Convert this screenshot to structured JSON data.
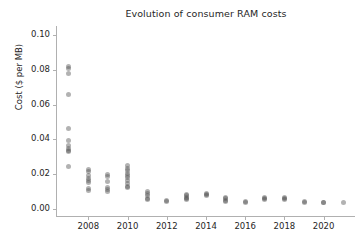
{
  "chart_data": {
    "type": "scatter",
    "title": "Evolution of consumer RAM costs",
    "xlabel": "",
    "ylabel": "Cost ($ per MB)",
    "xlim": [
      2006.4,
      2021.6
    ],
    "ylim": [
      -0.004,
      0.104
    ],
    "grid": false,
    "legend": null,
    "marker": {
      "shape": "circle",
      "color": "#555555",
      "opacity": 0.45,
      "size_px": 5
    },
    "xticks": [
      2008,
      2010,
      2012,
      2014,
      2016,
      2018,
      2020
    ],
    "xtick_labels": [
      "2008",
      "2010",
      "2012",
      "2014",
      "2016",
      "2018",
      "2020"
    ],
    "yticks": [
      0.0,
      0.02,
      0.04,
      0.06,
      0.08,
      0.1
    ],
    "ytick_labels": [
      "0.00",
      "0.02",
      "0.04",
      "0.06",
      "0.08",
      "0.10"
    ],
    "points": [
      {
        "x": 2007,
        "y": 0.082
      },
      {
        "x": 2007,
        "y": 0.0805
      },
      {
        "x": 2007,
        "y": 0.078
      },
      {
        "x": 2007,
        "y": 0.066
      },
      {
        "x": 2007,
        "y": 0.0462
      },
      {
        "x": 2007,
        "y": 0.0392
      },
      {
        "x": 2007,
        "y": 0.0365
      },
      {
        "x": 2007,
        "y": 0.035
      },
      {
        "x": 2007,
        "y": 0.0338
      },
      {
        "x": 2007,
        "y": 0.033
      },
      {
        "x": 2007,
        "y": 0.0245
      },
      {
        "x": 2008,
        "y": 0.0228
      },
      {
        "x": 2008,
        "y": 0.0215
      },
      {
        "x": 2008,
        "y": 0.0195
      },
      {
        "x": 2008,
        "y": 0.0178
      },
      {
        "x": 2008,
        "y": 0.0165
      },
      {
        "x": 2008,
        "y": 0.015
      },
      {
        "x": 2008,
        "y": 0.0118
      },
      {
        "x": 2008,
        "y": 0.0105
      },
      {
        "x": 2009,
        "y": 0.0198
      },
      {
        "x": 2009,
        "y": 0.0185
      },
      {
        "x": 2009,
        "y": 0.016
      },
      {
        "x": 2009,
        "y": 0.0122
      },
      {
        "x": 2009,
        "y": 0.0112
      },
      {
        "x": 2009,
        "y": 0.0102
      },
      {
        "x": 2010,
        "y": 0.0248
      },
      {
        "x": 2010,
        "y": 0.0235
      },
      {
        "x": 2010,
        "y": 0.0222
      },
      {
        "x": 2010,
        "y": 0.0205
      },
      {
        "x": 2010,
        "y": 0.0192
      },
      {
        "x": 2010,
        "y": 0.018
      },
      {
        "x": 2010,
        "y": 0.0165
      },
      {
        "x": 2010,
        "y": 0.0148
      },
      {
        "x": 2010,
        "y": 0.0132
      },
      {
        "x": 2010,
        "y": 0.0125
      },
      {
        "x": 2011,
        "y": 0.0102
      },
      {
        "x": 2011,
        "y": 0.0092
      },
      {
        "x": 2011,
        "y": 0.0078
      },
      {
        "x": 2011,
        "y": 0.0062
      },
      {
        "x": 2011,
        "y": 0.0055
      },
      {
        "x": 2012,
        "y": 0.0048
      },
      {
        "x": 2012,
        "y": 0.0042
      },
      {
        "x": 2013,
        "y": 0.0085
      },
      {
        "x": 2013,
        "y": 0.0078
      },
      {
        "x": 2013,
        "y": 0.0068
      },
      {
        "x": 2013,
        "y": 0.006
      },
      {
        "x": 2013,
        "y": 0.0052
      },
      {
        "x": 2014,
        "y": 0.0092
      },
      {
        "x": 2014,
        "y": 0.0085
      },
      {
        "x": 2014,
        "y": 0.0078
      },
      {
        "x": 2015,
        "y": 0.0068
      },
      {
        "x": 2015,
        "y": 0.0058
      },
      {
        "x": 2015,
        "y": 0.0048
      },
      {
        "x": 2015,
        "y": 0.0042
      },
      {
        "x": 2016,
        "y": 0.0045
      },
      {
        "x": 2016,
        "y": 0.0038
      },
      {
        "x": 2017,
        "y": 0.0068
      },
      {
        "x": 2017,
        "y": 0.006
      },
      {
        "x": 2017,
        "y": 0.0055
      },
      {
        "x": 2018,
        "y": 0.0068
      },
      {
        "x": 2018,
        "y": 0.006
      },
      {
        "x": 2018,
        "y": 0.0052
      },
      {
        "x": 2019,
        "y": 0.0045
      },
      {
        "x": 2019,
        "y": 0.0038
      },
      {
        "x": 2020,
        "y": 0.004
      },
      {
        "x": 2020,
        "y": 0.0035
      },
      {
        "x": 2021,
        "y": 0.0038
      }
    ]
  }
}
